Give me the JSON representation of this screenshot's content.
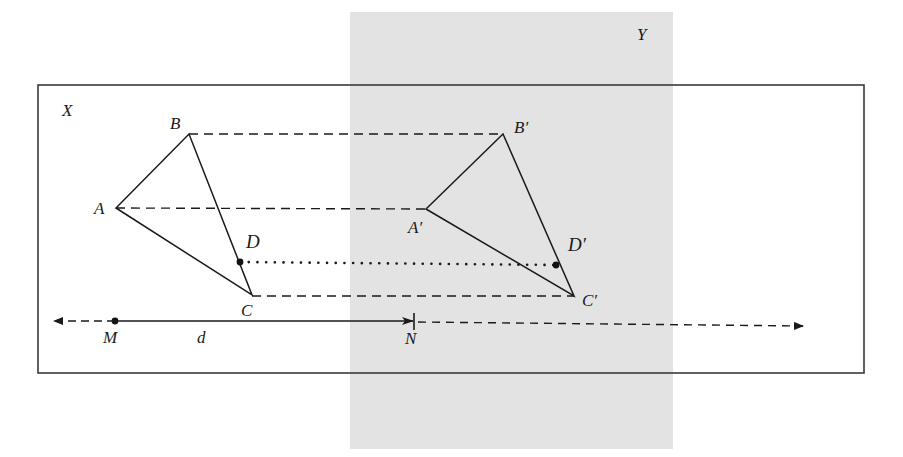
{
  "diagram": {
    "colors": {
      "line": "#1a1a1a",
      "plane_y_fill": "#e3e3e3",
      "plane_x_border": "#3a3a3a",
      "background": "#ffffff"
    },
    "planes": [
      {
        "id": "X",
        "label": "X",
        "x": 38,
        "y": 85,
        "width": 826,
        "height": 288,
        "style": "outline"
      },
      {
        "id": "Y",
        "label": "Y",
        "x": 350,
        "y": 12,
        "width": 323,
        "height": 437,
        "style": "shaded"
      }
    ],
    "points": {
      "A": {
        "label": "A",
        "x": 116,
        "y": 208
      },
      "B": {
        "label": "B",
        "x": 189,
        "y": 134
      },
      "C": {
        "label": "C",
        "x": 252,
        "y": 295
      },
      "D": {
        "label": "D",
        "x": 240,
        "y": 262
      },
      "A_prime": {
        "label": "A′",
        "x": 426,
        "y": 209
      },
      "B_prime": {
        "label": "B′",
        "x": 503,
        "y": 134
      },
      "C_prime": {
        "label": "C′",
        "x": 574,
        "y": 296
      },
      "D_prime": {
        "label": "D′",
        "x": 556,
        "y": 265
      },
      "M": {
        "label": "M",
        "x": 115,
        "y": 321
      },
      "N": {
        "label": "N",
        "x": 414,
        "y": 321
      }
    },
    "segments": {
      "triangle_original": [
        "AB",
        "BC",
        "CA"
      ],
      "triangle_image": [
        "A′B′",
        "B′C′",
        "C′A′"
      ],
      "correspondence_dashed": [
        "BB′",
        "AA′",
        "CC′"
      ],
      "correspondence_dotted": [
        "DD′"
      ]
    },
    "vector": {
      "from": "M",
      "to": "N",
      "label": "d",
      "line_extends_left_dashed": true,
      "line_extends_right_dashed": true
    }
  }
}
